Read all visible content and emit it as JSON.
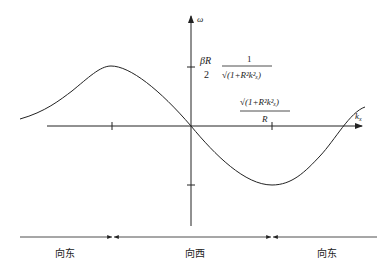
{
  "diagram": {
    "title": "",
    "axes": {
      "y_label": "ω",
      "x_label_main": "k",
      "x_label_sub": "x"
    },
    "y_tick_label": {
      "coef_num": "βR",
      "coef_den": "2",
      "frac_num": "1",
      "frac_den": "√(1+R²k²ₓ)"
    },
    "x_tick_label": {
      "num": "√(1+R²k²ₓ)",
      "den": "R"
    },
    "regions": [
      {
        "label": "向东"
      },
      {
        "label": "向西"
      },
      {
        "label": "向东"
      }
    ],
    "colors": {
      "line": "#222222",
      "background": "#ffffff"
    }
  }
}
